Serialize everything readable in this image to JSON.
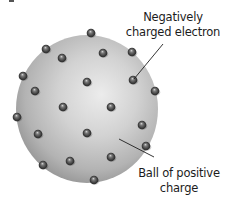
{
  "diagram": {
    "colors": {
      "background": "#ffffff",
      "sphere_light": "#e6e6e6",
      "sphere_mid": "#bdbdbd",
      "sphere_dark": "#8f8f8f",
      "electron_dark": "#2e2e2e",
      "electron_mid": "#6a6a6a",
      "electron_highlight": "#d8d8d8",
      "leader_line": "#1e1e1e",
      "text": "#1c1c1c"
    },
    "sphere": {
      "cx": 87,
      "cy": 109,
      "rx": 71,
      "ry": 74
    },
    "electron_radius": 4.3,
    "electrons": [
      {
        "x": 91,
        "y": 33
      },
      {
        "x": 46,
        "y": 49
      },
      {
        "x": 62,
        "y": 58
      },
      {
        "x": 103,
        "y": 53
      },
      {
        "x": 132,
        "y": 52
      },
      {
        "x": 23,
        "y": 76
      },
      {
        "x": 87,
        "y": 82
      },
      {
        "x": 133,
        "y": 80
      },
      {
        "x": 35,
        "y": 91
      },
      {
        "x": 155,
        "y": 91
      },
      {
        "x": 63,
        "y": 107
      },
      {
        "x": 111,
        "y": 107
      },
      {
        "x": 17,
        "y": 117
      },
      {
        "x": 142,
        "y": 125
      },
      {
        "x": 87,
        "y": 133
      },
      {
        "x": 38,
        "y": 134
      },
      {
        "x": 146,
        "y": 146
      },
      {
        "x": 70,
        "y": 161
      },
      {
        "x": 111,
        "y": 157
      },
      {
        "x": 43,
        "y": 165
      },
      {
        "x": 94,
        "y": 180
      }
    ],
    "labels": {
      "electron": {
        "line1": "Negatively",
        "line2": "charged electron",
        "leader": {
          "x1": 134,
          "y1": 79,
          "x2": 163,
          "y2": 44
        }
      },
      "positive_ball": {
        "line1": "Ball of positive",
        "line2": "charge",
        "leader": {
          "x1": 119,
          "y1": 139,
          "x2": 154,
          "y2": 157
        }
      }
    }
  }
}
